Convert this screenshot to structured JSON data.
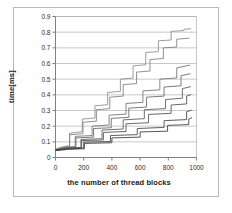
{
  "chart_data": {
    "type": "line",
    "title": "",
    "xlabel": "the number of thread blocks",
    "ylabel": "time[ms]",
    "xlim": [
      0,
      1000
    ],
    "ylim": [
      0,
      0.9
    ],
    "grid": true,
    "grid_axis": "y",
    "legend": "none",
    "xticks": [
      0,
      200,
      400,
      600,
      800,
      1000
    ],
    "xtick_labels": [
      "0",
      "200",
      "400",
      "600",
      "800",
      "1000"
    ],
    "yticks": [
      0,
      0.1,
      0.2,
      0.3,
      0.4,
      0.5,
      0.6,
      0.7,
      0.8,
      0.9
    ],
    "ytick_labels": [
      "0",
      "0.1",
      "0.2",
      "0.3",
      "0.4",
      "0.5",
      "0.6",
      "0.7",
      "0.8",
      "0.9"
    ],
    "step_shape": "staircase",
    "series": [
      {
        "name": "series-1",
        "color": "#8a8a8a",
        "x": [
          0,
          60,
          100,
          100,
          190,
          190,
          280,
          280,
          370,
          370,
          460,
          460,
          550,
          550,
          640,
          640,
          730,
          730,
          820,
          820,
          910,
          910,
          960
        ],
        "y": [
          0.055,
          0.07,
          0.075,
          0.155,
          0.165,
          0.245,
          0.252,
          0.33,
          0.337,
          0.415,
          0.422,
          0.5,
          0.507,
          0.585,
          0.592,
          0.67,
          0.676,
          0.745,
          0.75,
          0.805,
          0.81,
          0.818,
          0.822
        ]
      },
      {
        "name": "series-2",
        "color": "#7d7d7d",
        "x": [
          0,
          60,
          100,
          100,
          195,
          195,
          290,
          290,
          385,
          385,
          480,
          480,
          575,
          575,
          670,
          670,
          765,
          765,
          860,
          860,
          950
        ],
        "y": [
          0.05,
          0.065,
          0.07,
          0.145,
          0.152,
          0.225,
          0.232,
          0.305,
          0.312,
          0.385,
          0.392,
          0.465,
          0.472,
          0.545,
          0.552,
          0.625,
          0.632,
          0.7,
          0.705,
          0.755,
          0.762
        ]
      },
      {
        "name": "series-3",
        "color": "#6f6f6f",
        "x": [
          0,
          70,
          140,
          140,
          260,
          260,
          380,
          380,
          500,
          500,
          620,
          620,
          740,
          740,
          860,
          860,
          955
        ],
        "y": [
          0.05,
          0.065,
          0.07,
          0.135,
          0.14,
          0.2,
          0.207,
          0.27,
          0.277,
          0.345,
          0.352,
          0.425,
          0.432,
          0.5,
          0.508,
          0.572,
          0.59
        ]
      },
      {
        "name": "series-4",
        "color": "#646464",
        "x": [
          0,
          70,
          145,
          145,
          270,
          270,
          395,
          395,
          520,
          520,
          645,
          645,
          770,
          770,
          890,
          890,
          958
        ],
        "y": [
          0.048,
          0.062,
          0.066,
          0.125,
          0.13,
          0.185,
          0.19,
          0.25,
          0.256,
          0.315,
          0.322,
          0.385,
          0.392,
          0.45,
          0.458,
          0.522,
          0.535
        ]
      },
      {
        "name": "series-5",
        "color": "#585858",
        "x": [
          0,
          80,
          180,
          180,
          330,
          330,
          480,
          480,
          630,
          630,
          780,
          780,
          900,
          900,
          960
        ],
        "y": [
          0.047,
          0.06,
          0.064,
          0.115,
          0.12,
          0.175,
          0.182,
          0.24,
          0.248,
          0.305,
          0.312,
          0.37,
          0.378,
          0.44,
          0.452
        ]
      },
      {
        "name": "series-6",
        "color": "#4d4d4d",
        "x": [
          0,
          80,
          185,
          185,
          340,
          340,
          500,
          500,
          660,
          660,
          820,
          820,
          930,
          930,
          962
        ],
        "y": [
          0.046,
          0.058,
          0.062,
          0.108,
          0.112,
          0.16,
          0.166,
          0.215,
          0.222,
          0.275,
          0.282,
          0.335,
          0.342,
          0.392,
          0.402
        ]
      },
      {
        "name": "series-7",
        "color": "#414141",
        "x": [
          0,
          90,
          200,
          200,
          390,
          390,
          580,
          580,
          770,
          770,
          930,
          930,
          965
        ],
        "y": [
          0.045,
          0.055,
          0.06,
          0.098,
          0.102,
          0.14,
          0.146,
          0.185,
          0.192,
          0.235,
          0.242,
          0.292,
          0.302
        ]
      },
      {
        "name": "series-8",
        "color": "#363636",
        "x": [
          0,
          90,
          205,
          205,
          400,
          400,
          600,
          600,
          795,
          795,
          945,
          945,
          968
        ],
        "y": [
          0.044,
          0.052,
          0.056,
          0.09,
          0.094,
          0.125,
          0.13,
          0.163,
          0.168,
          0.205,
          0.21,
          0.245,
          0.255
        ]
      }
    ]
  },
  "style": {
    "axis_color": "#808080",
    "grid_color": "#b0b0b0",
    "frame_color": "#b9b9b9",
    "text_color": "#1a1a1a"
  }
}
